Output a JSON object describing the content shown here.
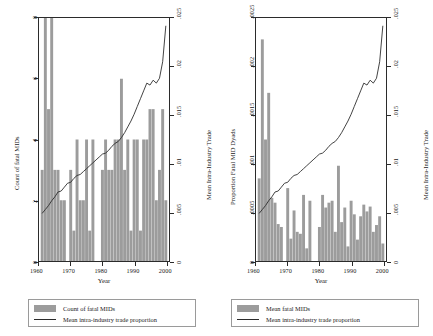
{
  "figure": {
    "width": 433,
    "height": 336,
    "bar_color": "#9c9c9c",
    "line_color": "#2b2b2b",
    "frame_color": "#2b2b2b",
    "background": "#ffffff"
  },
  "panels": [
    {
      "id": "left",
      "left_axis_title": "Count of fatal MIDs",
      "right_axis_title": "Mean Intra-Industry Trade",
      "x_axis_title": "Year",
      "left_ticks": [
        "0",
        "2",
        "4",
        "6",
        "8"
      ],
      "right_ticks": [
        "0",
        ".005",
        ".01",
        ".015",
        ".02",
        ".025"
      ],
      "x_ticks": [
        "1960",
        "1970",
        "1980",
        "1990",
        "2000"
      ],
      "legend": [
        {
          "marker": "bar-swatch",
          "label": "Count of fatal MIDs"
        },
        {
          "marker": "line-swatch",
          "label": "Mean intra-industry trade proportion"
        }
      ]
    },
    {
      "id": "right",
      "left_axis_title": "Proportion Fatal MID Dyads",
      "right_axis_title": "Mean Intra-Industry Trade",
      "x_axis_title": "Year",
      "left_ticks": [
        "0",
        ".0005",
        ".001",
        ".0015",
        ".002",
        ".0025"
      ],
      "right_ticks": [
        "0",
        ".005",
        ".01",
        ".015",
        ".02",
        ".025"
      ],
      "x_ticks": [
        "1960",
        "1970",
        "1980",
        "1990",
        "2000"
      ],
      "legend": [
        {
          "marker": "bar-swatch",
          "label": "Mean fatal MIDs"
        },
        {
          "marker": "line-swatch",
          "label": "Mean intra-industry trade proportion"
        }
      ]
    }
  ],
  "chart_data": [
    {
      "type": "bar",
      "id": "left-panel",
      "title": "",
      "xlabel": "Year",
      "ylabel": "Count of fatal MIDs",
      "y2label": "Mean Intra-Industry Trade",
      "xlim": [
        1960,
        2001
      ],
      "ylim": [
        0,
        8
      ],
      "y2lim": [
        0,
        0.025
      ],
      "grid": false,
      "legend_position": "below",
      "x": [
        1961,
        1962,
        1963,
        1964,
        1965,
        1966,
        1967,
        1968,
        1969,
        1970,
        1971,
        1972,
        1973,
        1974,
        1975,
        1976,
        1977,
        1978,
        1979,
        1980,
        1981,
        1982,
        1983,
        1984,
        1985,
        1986,
        1987,
        1988,
        1989,
        1990,
        1991,
        1992,
        1993,
        1994,
        1995,
        1996,
        1997,
        1998,
        1999,
        2000
      ],
      "series": [
        {
          "name": "Count of fatal MIDs",
          "type": "bar",
          "axis": "left",
          "values": [
            3,
            8,
            5,
            8,
            3,
            3,
            2,
            2,
            0,
            3,
            1,
            4,
            2,
            2,
            4,
            1,
            4,
            0,
            0,
            3,
            4,
            3,
            3,
            4,
            4,
            6,
            3,
            4,
            1,
            4,
            4,
            1,
            4,
            4,
            5,
            5,
            2,
            3,
            5,
            2
          ]
        },
        {
          "name": "Mean intra-industry trade proportion",
          "type": "line",
          "axis": "right",
          "values": [
            0.0049,
            0.0053,
            0.0057,
            0.0062,
            0.0066,
            0.0071,
            0.0072,
            0.0076,
            0.008,
            0.0081,
            0.0085,
            0.0088,
            0.0089,
            0.0092,
            0.0095,
            0.0098,
            0.0101,
            0.0104,
            0.0107,
            0.011,
            0.0111,
            0.0114,
            0.0118,
            0.0121,
            0.0123,
            0.0127,
            0.0132,
            0.0138,
            0.0144,
            0.0151,
            0.0159,
            0.0167,
            0.0175,
            0.0183,
            0.0181,
            0.0186,
            0.0183,
            0.0188,
            0.0205,
            0.0242
          ]
        }
      ]
    },
    {
      "type": "bar",
      "id": "right-panel",
      "title": "",
      "xlabel": "Year",
      "ylabel": "Proportion Fatal MID Dyads",
      "y2label": "Mean Intra-Industry Trade",
      "xlim": [
        1960,
        2001
      ],
      "ylim": [
        0,
        0.0025
      ],
      "y2lim": [
        0,
        0.025
      ],
      "grid": false,
      "legend_position": "below",
      "x": [
        1961,
        1962,
        1963,
        1964,
        1965,
        1966,
        1967,
        1968,
        1969,
        1970,
        1971,
        1972,
        1973,
        1974,
        1975,
        1976,
        1977,
        1978,
        1979,
        1980,
        1981,
        1982,
        1983,
        1984,
        1985,
        1986,
        1987,
        1988,
        1989,
        1990,
        1991,
        1992,
        1993,
        1994,
        1995,
        1996,
        1997,
        1998,
        1999,
        2000
      ],
      "series": [
        {
          "name": "Mean fatal MIDs",
          "type": "bar",
          "axis": "left",
          "values": [
            0.00085,
            0.00228,
            0.00125,
            0.00173,
            0.00065,
            0.0006,
            0.00038,
            0.00035,
            0.0,
            0.00075,
            0.00023,
            0.00052,
            0.0003,
            0.00028,
            0.00068,
            0.00013,
            0.00062,
            0.0,
            0.0,
            0.00035,
            0.00068,
            0.00055,
            0.0006,
            0.00062,
            0.0003,
            0.00098,
            0.0004,
            0.00055,
            0.00015,
            0.00062,
            0.00048,
            0.00022,
            0.00046,
            0.00058,
            0.00051,
            0.00056,
            0.0003,
            0.00037,
            0.00046,
            0.00018
          ]
        },
        {
          "name": "Mean intra-industry trade proportion",
          "type": "line",
          "axis": "right",
          "values": [
            0.0049,
            0.0053,
            0.0057,
            0.0062,
            0.0066,
            0.0071,
            0.0072,
            0.0076,
            0.008,
            0.0081,
            0.0085,
            0.0088,
            0.0089,
            0.0092,
            0.0095,
            0.0098,
            0.0101,
            0.0104,
            0.0107,
            0.011,
            0.0111,
            0.0114,
            0.0118,
            0.0121,
            0.0123,
            0.0127,
            0.0132,
            0.0138,
            0.0144,
            0.0151,
            0.0159,
            0.0167,
            0.0175,
            0.0183,
            0.0181,
            0.0186,
            0.0183,
            0.0188,
            0.0205,
            0.0242
          ]
        }
      ]
    }
  ]
}
